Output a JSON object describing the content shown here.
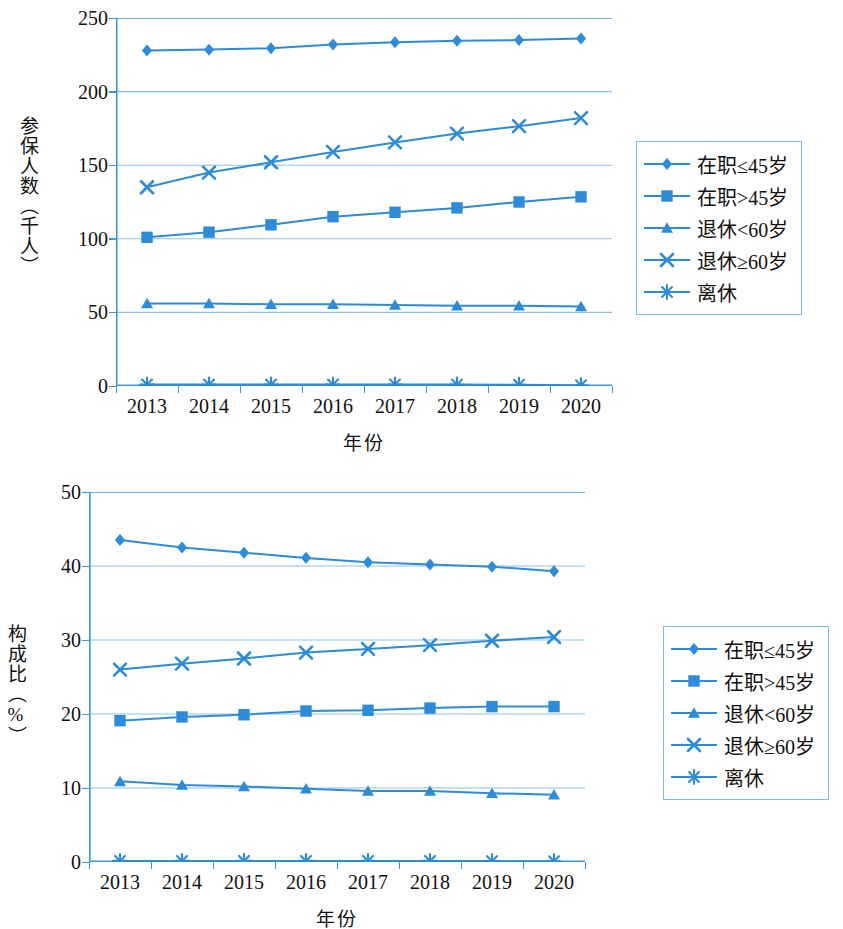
{
  "figure": {
    "accent_color": "#2e8bd8",
    "grid_color": "#8cc1ea",
    "axis_color": "#3f95dc"
  },
  "legend": {
    "items": [
      {
        "label": "在职≤45岁",
        "marker": "diamond-marker"
      },
      {
        "label": "在职>45岁",
        "marker": "square-marker"
      },
      {
        "label": "退休<60岁",
        "marker": "triangle-marker"
      },
      {
        "label": "退休≥60岁",
        "marker": "cross-marker"
      },
      {
        "label": "离休",
        "marker": "asterisk-marker"
      }
    ]
  },
  "chart_data": [
    {
      "type": "line",
      "title": "",
      "xlabel": "年份",
      "ylabel": "参保人数（千人）",
      "categories": [
        "2013",
        "2014",
        "2015",
        "2016",
        "2017",
        "2018",
        "2019",
        "2020"
      ],
      "ylim": [
        0,
        250
      ],
      "yticks": [
        "0",
        "50",
        "100",
        "150",
        "200",
        "250"
      ],
      "ytick_values": [
        0,
        50,
        100,
        150,
        200,
        250
      ],
      "grid": true,
      "legend_position": "right",
      "series": [
        {
          "name": "在职≤45岁",
          "marker": "diamond-marker",
          "values": [
            228,
            228.5,
            229.5,
            232,
            233.5,
            234.5,
            235,
            236
          ]
        },
        {
          "name": "在职>45岁",
          "marker": "square-marker",
          "values": [
            101,
            104.5,
            109.5,
            115,
            118,
            121,
            125,
            128.5
          ]
        },
        {
          "name": "退休<60岁",
          "marker": "triangle-marker",
          "values": [
            56,
            56,
            55.5,
            55.5,
            55,
            54.5,
            54.5,
            54
          ]
        },
        {
          "name": "退休≥60岁",
          "marker": "cross-marker",
          "values": [
            135,
            145,
            152,
            159,
            165.5,
            171.5,
            176.5,
            182
          ]
        },
        {
          "name": "离休",
          "marker": "asterisk-marker",
          "values": [
            1,
            1,
            1,
            1,
            1,
            1,
            0.8,
            0.5
          ]
        }
      ]
    },
    {
      "type": "line",
      "title": "",
      "xlabel": "年份",
      "ylabel": "构成比（%）",
      "categories": [
        "2013",
        "2014",
        "2015",
        "2016",
        "2017",
        "2018",
        "2019",
        "2020"
      ],
      "ylim": [
        0,
        50
      ],
      "yticks": [
        "0",
        "10",
        "20",
        "30",
        "40",
        "50"
      ],
      "ytick_values": [
        0,
        10,
        20,
        30,
        40,
        50
      ],
      "grid": true,
      "legend_position": "right",
      "series": [
        {
          "name": "在职≤45岁",
          "marker": "diamond-marker",
          "values": [
            43.5,
            42.5,
            41.8,
            41.1,
            40.5,
            40.2,
            39.9,
            39.3
          ]
        },
        {
          "name": "在职>45岁",
          "marker": "square-marker",
          "values": [
            19.1,
            19.6,
            19.9,
            20.4,
            20.5,
            20.8,
            21.0,
            21.0
          ]
        },
        {
          "name": "退休<60岁",
          "marker": "triangle-marker",
          "values": [
            10.9,
            10.4,
            10.2,
            9.9,
            9.6,
            9.6,
            9.3,
            9.1
          ]
        },
        {
          "name": "退休≥60岁",
          "marker": "cross-marker",
          "values": [
            26.0,
            26.8,
            27.5,
            28.3,
            28.8,
            29.3,
            29.9,
            30.4
          ]
        },
        {
          "name": "离休",
          "marker": "asterisk-marker",
          "values": [
            0.15,
            0.15,
            0.15,
            0.15,
            0.15,
            0.15,
            0.12,
            0.1
          ]
        }
      ]
    }
  ]
}
